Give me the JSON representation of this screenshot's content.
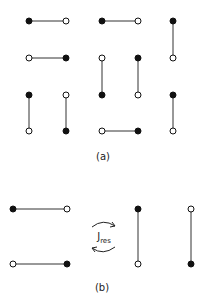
{
  "panel_a": {
    "label": "(a)",
    "bonds": [
      {
        "x1": 29,
        "y1": 21,
        "x2": 66,
        "y2": 21,
        "fill1": "black",
        "fill2": "white"
      },
      {
        "x1": 102,
        "y1": 21,
        "x2": 138,
        "y2": 21,
        "fill1": "black",
        "fill2": "white"
      },
      {
        "x1": 173,
        "y1": 21,
        "x2": 173,
        "y2": 58,
        "fill1": "black",
        "fill2": "white"
      },
      {
        "x1": 29,
        "y1": 58,
        "x2": 66,
        "y2": 58,
        "fill1": "white",
        "fill2": "black"
      },
      {
        "x1": 102,
        "y1": 58,
        "x2": 102,
        "y2": 95,
        "fill1": "white",
        "fill2": "black"
      },
      {
        "x1": 138,
        "y1": 58,
        "x2": 138,
        "y2": 95,
        "fill1": "black",
        "fill2": "white"
      },
      {
        "x1": 29,
        "y1": 95,
        "x2": 29,
        "y2": 131,
        "fill1": "black",
        "fill2": "white"
      },
      {
        "x1": 66,
        "y1": 95,
        "x2": 66,
        "y2": 131,
        "fill1": "white",
        "fill2": "black"
      },
      {
        "x1": 173,
        "y1": 95,
        "x2": 173,
        "y2": 131,
        "fill1": "black",
        "fill2": "white"
      },
      {
        "x1": 102,
        "y1": 131,
        "x2": 138,
        "y2": 131,
        "fill1": "white",
        "fill2": "black"
      }
    ]
  },
  "panel_b": {
    "label": "(b)",
    "coupling_symbol": "J",
    "coupling_subscript": "res",
    "bonds": [
      {
        "x1": 13,
        "y1": 209,
        "x2": 67,
        "y2": 209,
        "fill1": "black",
        "fill2": "white"
      },
      {
        "x1": 13,
        "y1": 264,
        "x2": 67,
        "y2": 264,
        "fill1": "white",
        "fill2": "black"
      },
      {
        "x1": 138,
        "y1": 209,
        "x2": 138,
        "y2": 264,
        "fill1": "black",
        "fill2": "white"
      },
      {
        "x1": 191,
        "y1": 209,
        "x2": 191,
        "y2": 264,
        "fill1": "white",
        "fill2": "black"
      }
    ]
  },
  "colors": {
    "line": "#333333",
    "dot_filled": "#111111",
    "dot_open": "#ffffff"
  }
}
